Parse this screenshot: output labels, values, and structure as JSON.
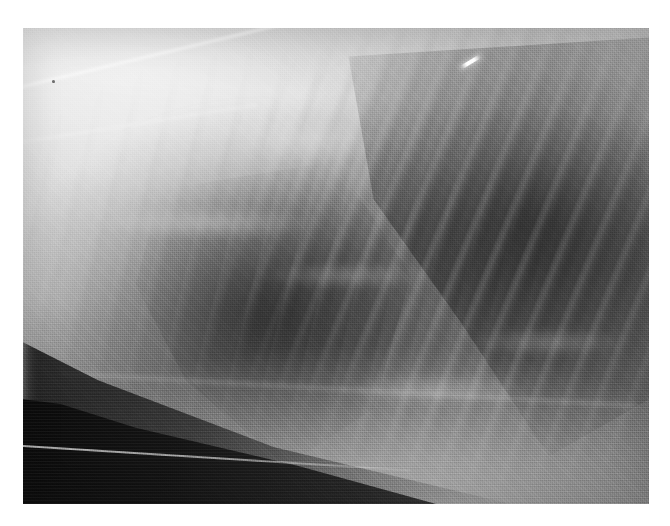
{
  "page": {
    "width": 670,
    "height": 526,
    "background_color": "#ffffff",
    "caption": ""
  },
  "image": {
    "kind": "radiograph",
    "modality": "X-ray",
    "view": "lateral thoracic radiograph",
    "subject": "small animal thorax",
    "orientation": "cranial to the left, dorsal at the top",
    "plate": {
      "left": 23,
      "top": 28,
      "width": 626,
      "height": 476,
      "border_color": "#ffffff"
    },
    "tone": {
      "brightest": "#f2f2f2",
      "bright_soft_tissue": "#cfcfcf",
      "mid_gray": "#8d8d8d",
      "lung_lucency": "#6a6a6a",
      "dark_shadow": "#3a3a3a",
      "table_edge_black": "#0a0a0a",
      "marker_white": "#ffffff"
    },
    "features": [
      {
        "name": "vertebral-column",
        "label": "Bright vertebral / epaxial band",
        "region": "upper third, spanning full width"
      },
      {
        "name": "scapular-border",
        "label": "Oblique bright scapular border",
        "region": "upper left, running down-left from upper right"
      },
      {
        "name": "cranial-thorax",
        "label": "Bright cranial soft tissue / thoracic inlet",
        "region": "left third"
      },
      {
        "name": "caudodorsal-lung-field",
        "label": "Dark caudodorsal lung lucency",
        "region": "right third, triangular"
      },
      {
        "name": "cardiac-silhouette",
        "label": "Cardiac / mediastinal soft tissue opacity",
        "region": "centre, left of midline"
      },
      {
        "name": "rib-shadows",
        "label": "Oblique rib striations",
        "region": "across caudal lung field"
      },
      {
        "name": "diaphragm",
        "label": "Diaphragmatic / cranial abdominal interface",
        "region": "lower third, sweeping left to right"
      },
      {
        "name": "radiopaque-marker",
        "label": "Small radiopaque metallic marker",
        "region": "upper right"
      },
      {
        "name": "table-edge",
        "label": "Dark collimated table edge wedge",
        "region": "bottom left corner"
      },
      {
        "name": "dust-speck",
        "label": "Dark speck artifact",
        "region": "upper left"
      }
    ]
  }
}
